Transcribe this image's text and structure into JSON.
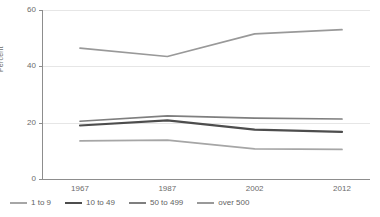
{
  "chart_data": {
    "type": "line",
    "title": "",
    "xlabel": "",
    "ylabel": "Percent",
    "categories": [
      "1967",
      "1987",
      "2002",
      "2012"
    ],
    "ylim": [
      0,
      60
    ],
    "yticks": [
      0,
      20,
      40,
      60
    ],
    "grid": true,
    "legend_position": "bottom",
    "series": [
      {
        "name": "1 to 9",
        "values": [
          13.5,
          13.8,
          10.7,
          10.5
        ],
        "color": "#a6a6a6"
      },
      {
        "name": "10 to 49",
        "values": [
          19.0,
          20.8,
          17.5,
          16.7
        ],
        "color": "#4d4d4d"
      },
      {
        "name": "50 to 499",
        "values": [
          20.5,
          22.4,
          21.6,
          21.3
        ],
        "color": "#7f7f7f"
      },
      {
        "name": "over 500",
        "values": [
          46.5,
          43.5,
          51.5,
          53.0
        ],
        "color": "#999999"
      }
    ]
  },
  "axis": {
    "y_title": "Percent",
    "y_tick_labels": [
      "0",
      "20",
      "40",
      "60"
    ],
    "x_tick_labels": [
      "1967",
      "1987",
      "2002",
      "2012"
    ]
  },
  "legend": {
    "items": [
      {
        "label": "1 to 9"
      },
      {
        "label": "10 to 49"
      },
      {
        "label": "50 to 499"
      },
      {
        "label": "over 500"
      }
    ]
  }
}
